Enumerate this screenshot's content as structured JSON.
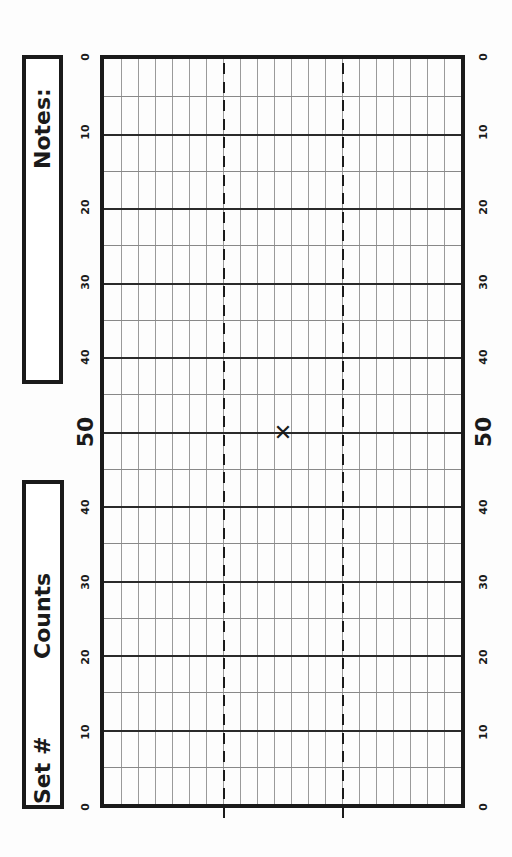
{
  "notes_box": {
    "label": "Notes:"
  },
  "set_box": {
    "set_label": "Set #",
    "counts_label": "Counts"
  },
  "chart_data": {
    "type": "diagram",
    "yard_labels": [
      "0",
      "10",
      "20",
      "30",
      "40",
      "50",
      "40",
      "30",
      "20",
      "10",
      "0"
    ],
    "yard_lines_5": 20,
    "grid_columns": 21,
    "hash_columns": [
      7,
      14
    ],
    "marker": {
      "symbol": "✕",
      "yard": 50,
      "column": 10.5
    }
  },
  "marker_symbol": "✕"
}
